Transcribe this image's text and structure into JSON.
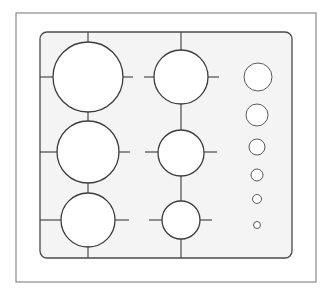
{
  "diagram": {
    "colors": {
      "background": "#ffffff",
      "frame_stroke": "#8a8a8a",
      "panel_fill": "#f4f4f4",
      "panel_stroke": "#4a4a4a",
      "burner_stroke": "#3c3c3c",
      "knob_stroke": "#5a5a5a"
    },
    "outer_frame": {
      "x": 16,
      "y": 13,
      "width": 300,
      "height": 269
    },
    "panel": {
      "x": 40,
      "y": 32,
      "width": 252,
      "height": 226,
      "corner_radius": 7
    },
    "grid_lines": {
      "vertical": [
        {
          "x": 88,
          "y1": 32,
          "y2": 42
        },
        {
          "x": 88,
          "y1": 112,
          "y2": 121
        },
        {
          "x": 88,
          "y1": 183,
          "y2": 193
        },
        {
          "x": 88,
          "y1": 247,
          "y2": 258
        },
        {
          "x": 181,
          "y1": 32,
          "y2": 50
        },
        {
          "x": 181,
          "y1": 104,
          "y2": 130
        },
        {
          "x": 181,
          "y1": 176,
          "y2": 201
        },
        {
          "x": 181,
          "y1": 239,
          "y2": 258
        }
      ],
      "horizontal": [
        {
          "y": 77,
          "x1": 40,
          "x2": 53
        },
        {
          "y": 77,
          "x1": 123,
          "x2": 133
        },
        {
          "y": 77,
          "x1": 144,
          "x2": 154
        },
        {
          "y": 77,
          "x1": 208,
          "x2": 219
        },
        {
          "y": 152,
          "x1": 40,
          "x2": 57
        },
        {
          "y": 152,
          "x1": 119,
          "x2": 130
        },
        {
          "y": 152,
          "x1": 145,
          "x2": 158
        },
        {
          "y": 152,
          "x1": 204,
          "x2": 217
        },
        {
          "y": 220,
          "x1": 40,
          "x2": 61
        },
        {
          "y": 220,
          "x1": 115,
          "x2": 129
        },
        {
          "y": 220,
          "x1": 149,
          "x2": 162
        },
        {
          "y": 220,
          "x1": 200,
          "x2": 212
        }
      ]
    },
    "burners": [
      {
        "name": "burner-left-top",
        "cx": 88,
        "cy": 77,
        "r": 35
      },
      {
        "name": "burner-left-middle",
        "cx": 88,
        "cy": 152,
        "r": 31
      },
      {
        "name": "burner-left-bottom",
        "cx": 88,
        "cy": 220,
        "r": 27
      },
      {
        "name": "burner-middle-top",
        "cx": 181,
        "cy": 77,
        "r": 27
      },
      {
        "name": "burner-middle-middle",
        "cx": 181,
        "cy": 153,
        "r": 23
      },
      {
        "name": "burner-middle-bottom",
        "cx": 181,
        "cy": 220,
        "r": 19
      }
    ],
    "knobs": [
      {
        "name": "knob-1",
        "cx": 258,
        "cy": 77,
        "r": 14
      },
      {
        "name": "knob-2",
        "cx": 257,
        "cy": 115,
        "r": 11
      },
      {
        "name": "knob-3",
        "cx": 257,
        "cy": 147,
        "r": 8
      },
      {
        "name": "knob-4",
        "cx": 257,
        "cy": 175,
        "r": 6
      },
      {
        "name": "knob-5",
        "cx": 257,
        "cy": 199,
        "r": 4.5
      },
      {
        "name": "knob-6",
        "cx": 257,
        "cy": 225,
        "r": 3.5
      }
    ]
  }
}
